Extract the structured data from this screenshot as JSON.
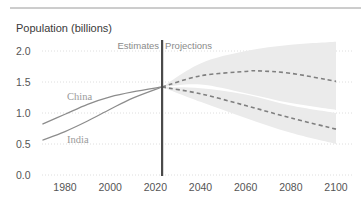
{
  "chart_data": {
    "type": "line",
    "title": "Population (billions)",
    "xlabel": "",
    "ylabel": "Population (billions)",
    "xlim": [
      1970,
      2100
    ],
    "ylim": [
      0,
      2.0
    ],
    "x_ticks": [
      "1980",
      "2000",
      "2020",
      "2040",
      "2060",
      "2080",
      "2100"
    ],
    "y_ticks": [
      "0.0",
      "0.5",
      "1.0",
      "1.5",
      "2.0"
    ],
    "grid": "horizontal dotted",
    "annotations": {
      "divider_year": 2023,
      "left_label": "Estimates",
      "right_label": "Projections"
    },
    "series": [
      {
        "name": "China",
        "style": "solid (estimates) / dashed (projection)",
        "estimates": {
          "x": [
            1970,
            1980,
            1990,
            2000,
            2010,
            2023
          ],
          "values": [
            0.82,
            0.98,
            1.14,
            1.26,
            1.34,
            1.42
          ]
        },
        "projection": {
          "x": [
            2023,
            2040,
            2060,
            2080,
            2100
          ],
          "values": [
            1.42,
            1.31,
            1.12,
            0.92,
            0.74
          ]
        },
        "projection_band": {
          "x": [
            2023,
            2040,
            2060,
            2080,
            2100
          ],
          "lower": [
            1.42,
            1.18,
            0.92,
            0.68,
            0.5
          ],
          "upper": [
            1.42,
            1.4,
            1.3,
            1.12,
            1.0
          ]
        }
      },
      {
        "name": "India",
        "style": "solid (estimates) / dashed (projection)",
        "estimates": {
          "x": [
            1970,
            1980,
            1990,
            2000,
            2010,
            2023
          ],
          "values": [
            0.56,
            0.7,
            0.87,
            1.06,
            1.24,
            1.42
          ]
        },
        "projection": {
          "x": [
            2023,
            2040,
            2060,
            2065,
            2080,
            2100
          ],
          "values": [
            1.42,
            1.6,
            1.67,
            1.68,
            1.64,
            1.51
          ]
        },
        "projection_band": {
          "x": [
            2023,
            2040,
            2060,
            2080,
            2100
          ],
          "lower": [
            1.42,
            1.46,
            1.32,
            1.16,
            1.05
          ],
          "upper": [
            1.42,
            1.8,
            2.0,
            2.1,
            2.15
          ]
        }
      }
    ]
  },
  "labels": {
    "title": "Population (billions)",
    "estimates": "Estimates",
    "projections": "Projections",
    "china": "China",
    "india": "India"
  },
  "colors": {
    "line": "#8c8c8c",
    "dashed": "#7f7f7f",
    "band": "#ebebeb",
    "divider": "#4a4a4a",
    "grid": "#d6d6d6",
    "rule": "#9a9a9a"
  }
}
